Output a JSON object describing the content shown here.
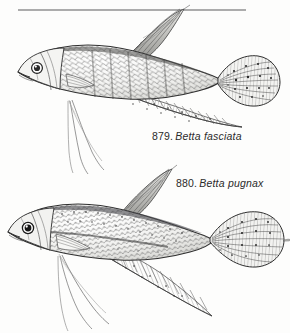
{
  "plate": {
    "background_color": "#fdfdfc",
    "ink_color": "#1f1f1f",
    "rule": {
      "name": "horizontal-rule",
      "x1": 18,
      "y1": 10,
      "x2": 246,
      "y2": 10
    }
  },
  "figures": [
    {
      "number": "879.",
      "species": "Betta fasciata",
      "common_label": "879. Betta fasciata",
      "position": "top",
      "caudal_fin_shape": "rounded-spotted",
      "dorsal_fin_shape": "pointed-tall",
      "eye": "large-ringed",
      "body_pattern": "crosshatched-scales-with-lateral-bars"
    },
    {
      "number": "880.",
      "species": "Betta pugnax",
      "common_label": "880. Betta pugnax",
      "position": "bottom",
      "caudal_fin_shape": "lanceolate-pointed-spotted",
      "dorsal_fin_shape": "pointed-tall",
      "eye": "large-dark-pupil",
      "body_pattern": "speckled-scales-with-dark-lateral-stripe"
    }
  ],
  "captions": {
    "fig879": {
      "number": "879.",
      "species": "Betta fasciata"
    },
    "fig880": {
      "number": "880.",
      "species": "Betta pugnax"
    }
  }
}
